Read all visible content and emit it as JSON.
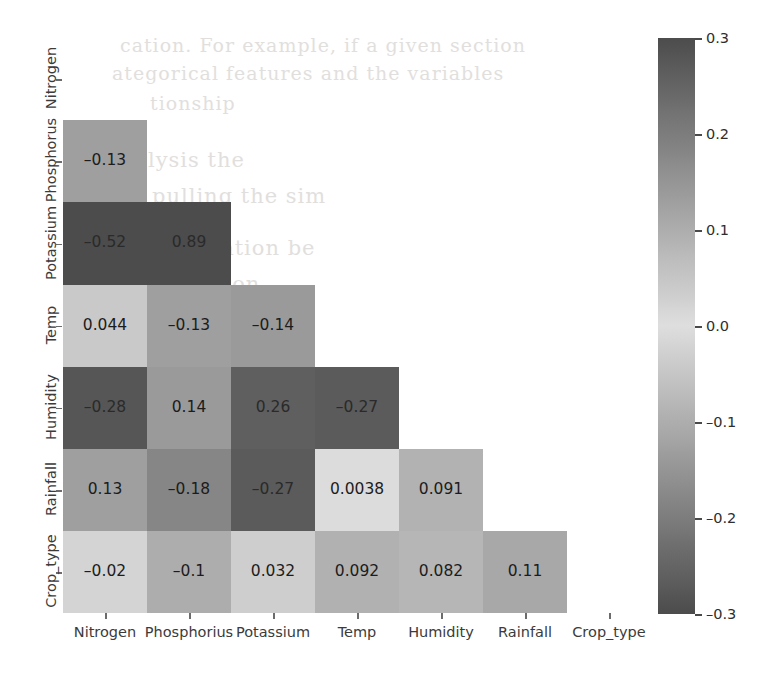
{
  "chart_data": {
    "type": "heatmap",
    "title": "",
    "xlabel": "",
    "ylabel": "",
    "mask": "lower-triangle",
    "grid": false,
    "annotated": true,
    "colormap": "diverging-grayscale",
    "colorbar": {
      "position": "right",
      "vmin": -0.3,
      "vmax": 0.3,
      "ticks": [
        0.3,
        0.2,
        0.1,
        0.0,
        -0.1,
        -0.2,
        -0.3
      ],
      "tick_labels": [
        "0.3",
        "0.2",
        "0.1",
        "0.0",
        "–0.1",
        "–0.2",
        "–0.3"
      ]
    },
    "y_categories": [
      "Nitrogen",
      "Phosphorus",
      "Potassium",
      "Temp",
      "Humidity",
      "Rainfall",
      "Crop_type"
    ],
    "x_categories": [
      "Nitrogen",
      "Phosphorius",
      "Potassium",
      "Temp",
      "Humidity",
      "Rainfall",
      "Crop_type"
    ],
    "rows": [
      {
        "label": "Nitrogen",
        "cells": []
      },
      {
        "label": "Phosphorus",
        "cells": [
          {
            "col": "Nitrogen",
            "value": -0.13,
            "text": "–0.13"
          }
        ]
      },
      {
        "label": "Potassium",
        "cells": [
          {
            "col": "Nitrogen",
            "value": -0.52,
            "text": "–0.52"
          },
          {
            "col": "Phosphorius",
            "value": 0.89,
            "text": "0.89"
          }
        ]
      },
      {
        "label": "Temp",
        "cells": [
          {
            "col": "Nitrogen",
            "value": 0.044,
            "text": "0.044"
          },
          {
            "col": "Phosphorius",
            "value": -0.13,
            "text": "–0.13"
          },
          {
            "col": "Potassium",
            "value": -0.14,
            "text": "–0.14"
          }
        ]
      },
      {
        "label": "Humidity",
        "cells": [
          {
            "col": "Nitrogen",
            "value": -0.28,
            "text": "–0.28"
          },
          {
            "col": "Phosphorius",
            "value": 0.14,
            "text": "0.14"
          },
          {
            "col": "Potassium",
            "value": 0.26,
            "text": "0.26"
          },
          {
            "col": "Temp",
            "value": -0.27,
            "text": "–0.27"
          }
        ]
      },
      {
        "label": "Rainfall",
        "cells": [
          {
            "col": "Nitrogen",
            "value": 0.13,
            "text": "0.13"
          },
          {
            "col": "Phosphorius",
            "value": -0.18,
            "text": "–0.18"
          },
          {
            "col": "Potassium",
            "value": -0.27,
            "text": "–0.27"
          },
          {
            "col": "Temp",
            "value": 0.0038,
            "text": "0.0038"
          },
          {
            "col": "Humidity",
            "value": 0.091,
            "text": "0.091"
          }
        ]
      },
      {
        "label": "Crop_type",
        "cells": [
          {
            "col": "Nitrogen",
            "value": -0.02,
            "text": "–0.02"
          },
          {
            "col": "Phosphorius",
            "value": -0.1,
            "text": "–0.1"
          },
          {
            "col": "Potassium",
            "value": 0.032,
            "text": "0.032"
          },
          {
            "col": "Temp",
            "value": 0.092,
            "text": "0.092"
          },
          {
            "col": "Humidity",
            "value": 0.082,
            "text": "0.082"
          },
          {
            "col": "Rainfall",
            "value": 0.11,
            "text": "0.11"
          }
        ]
      }
    ]
  },
  "colors": {
    "page_background": "#ffffff",
    "extreme_dark": "#4c4c4c",
    "neutral_light": "#d5d5d5",
    "axis_text": "#3b3b3b",
    "bleed_text": "#c9c6c2"
  },
  "scan_artifacts": {
    "bleed_lines": [
      {
        "text": "cation. For example, if a given section",
        "x": 120,
        "y": 34,
        "size": 19
      },
      {
        "text": "ategorical  features  and  the  variables",
        "x": 112,
        "y": 62,
        "size": 19
      },
      {
        "text": "tionship",
        "x": 150,
        "y": 92,
        "size": 19
      },
      {
        "text": "lysis the",
        "x": 148,
        "y": 148,
        "size": 21
      },
      {
        "text": "pulling  the  sim",
        "x": 152,
        "y": 184,
        "size": 21
      },
      {
        "text": "elation  be",
        "x": 200,
        "y": 236,
        "size": 21
      },
      {
        "text": "tion",
        "x": 215,
        "y": 272,
        "size": 21
      }
    ]
  }
}
